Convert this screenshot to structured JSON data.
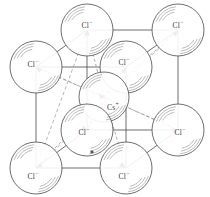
{
  "figure": {
    "type": "crystal-unit-cell-diagram",
    "background_color": "#ffffff",
    "line_color": "#4a4a4a",
    "dashed_color": "#8c8c8c",
    "sphere_stroke": "#555555",
    "sphere_fill": "#ffffff",
    "label_color": "#3a3a3a"
  },
  "ions": [
    {
      "id": "cl-back-top-left",
      "label": "Cl",
      "charge": "−",
      "x": 87,
      "y": 30,
      "r": 26,
      "label_x": 87,
      "label_y": 26
    },
    {
      "id": "cl-back-top-right",
      "label": "Cl",
      "charge": "−",
      "x": 178,
      "y": 30,
      "r": 26,
      "label_x": 178,
      "label_y": 26
    },
    {
      "id": "cl-front-top-left",
      "label": "Cl",
      "charge": "−",
      "x": 36,
      "y": 67,
      "r": 26,
      "label_x": 33,
      "label_y": 65
    },
    {
      "id": "cl-front-top-right",
      "label": "Cl",
      "charge": "−",
      "x": 126,
      "y": 67,
      "r": 26,
      "label_x": 124,
      "label_y": 63
    },
    {
      "id": "cs-body-centre",
      "label": "Cs",
      "charge": "+",
      "x": 104,
      "y": 97,
      "r": 25,
      "label_x": 113,
      "label_y": 108
    },
    {
      "id": "cl-back-bottom-left",
      "label": "Cl",
      "charge": "−",
      "x": 87,
      "y": 130,
      "r": 26,
      "label_x": 84,
      "label_y": 133
    },
    {
      "id": "cl-back-bottom-right",
      "label": "Cl",
      "charge": "−",
      "x": 178,
      "y": 130,
      "r": 26,
      "label_x": 180,
      "label_y": 133
    },
    {
      "id": "cl-front-bottom-left",
      "label": "Cl",
      "charge": "−",
      "x": 36,
      "y": 168,
      "r": 26,
      "label_x": 33,
      "label_y": 177
    },
    {
      "id": "cl-front-bottom-right",
      "label": "Cl",
      "charge": "−",
      "x": 126,
      "y": 168,
      "r": 26,
      "label_x": 124,
      "label_y": 177
    }
  ],
  "cell": {
    "vertices": {
      "back_top_left": [
        87,
        30
      ],
      "back_top_right": [
        178,
        30
      ],
      "front_top_left": [
        36,
        67
      ],
      "front_top_right": [
        126,
        67
      ],
      "back_bottom_left": [
        87,
        130
      ],
      "back_bottom_right": [
        178,
        130
      ],
      "front_bottom_left": [
        36,
        168
      ],
      "front_bottom_right": [
        126,
        168
      ]
    },
    "centre": [
      104,
      97
    ],
    "marker_dot": [
      92,
      152
    ]
  }
}
